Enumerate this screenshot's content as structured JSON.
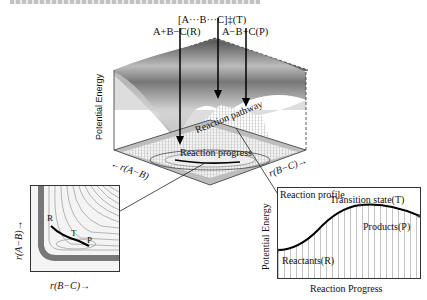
{
  "figure": {
    "labels_top": {
      "transition_state": "[A···B···C]‡(T)",
      "reactants": "A+B−C(R)",
      "products": "A−B+C(P)"
    },
    "surface": {
      "y_axis": "Potential Energy",
      "pathway_label": "Reaction pathway",
      "progress_label": "Reaction progress",
      "x_axis_left": "←r(A−B)",
      "x_axis_right": "r(B−C)→"
    },
    "contour_panel": {
      "y_axis": "r(A−B)→",
      "x_axis": "r(B−C)→",
      "point_R": "R",
      "point_T": "T",
      "point_P": "P"
    },
    "profile_panel": {
      "title": "Reaction profile",
      "y_axis": "Potential Energy",
      "x_axis": "Reaction Progress",
      "transition": "Transition state(T)",
      "products": "Products(P)",
      "reactants": "Reactants(R)"
    }
  }
}
